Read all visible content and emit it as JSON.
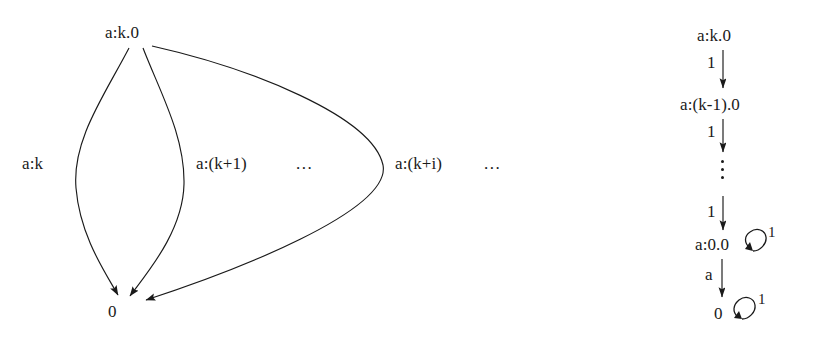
{
  "figure": {
    "background_color": "#ffffff",
    "stroke_color": "#1a1a1a"
  },
  "left_diagram": {
    "name": "infinitely-branching-transition-system",
    "nodes": [
      {
        "id": "top",
        "label": "a:k.0",
        "x": 136,
        "y": 33
      },
      {
        "id": "bottom",
        "label": "0",
        "x": 120,
        "y": 312
      }
    ],
    "edge_labels": [
      {
        "id": "edge-label-ak",
        "label": "a:k",
        "x": 22,
        "y": 163
      },
      {
        "id": "edge-label-ak1",
        "label": "a:(k+1)",
        "x": 196,
        "y": 163
      },
      {
        "id": "ellipsis-mid",
        "label": "...",
        "x": 298,
        "y": 163
      },
      {
        "id": "edge-label-aki",
        "label": "a:(k+i)",
        "x": 397,
        "y": 163
      },
      {
        "id": "ellipsis-right",
        "label": "...",
        "x": 485,
        "y": 163
      }
    ]
  },
  "right_diagram": {
    "name": "sequential-reduction-chain",
    "nodes": [
      {
        "id": "r1",
        "label": "a:k.0",
        "x": 727,
        "y": 36
      },
      {
        "id": "r2",
        "label": "a:(k-1).0",
        "x": 727,
        "y": 105
      },
      {
        "id": "r3",
        "label": "a:0.0",
        "x": 722,
        "y": 245
      },
      {
        "id": "r4",
        "label": "0",
        "x": 718,
        "y": 314
      }
    ],
    "vertical_ellipsis": {
      "id": "vertical-dots",
      "x": 723,
      "y": 160
    },
    "edge_labels": [
      {
        "id": "r-edge-1",
        "label": "1",
        "x": 708,
        "y": 62
      },
      {
        "id": "r-edge-2",
        "label": "1",
        "x": 708,
        "y": 131
      },
      {
        "id": "r-edge-3",
        "label": "1",
        "x": 708,
        "y": 211
      },
      {
        "id": "r-edge-4",
        "label": "a",
        "x": 706,
        "y": 274
      }
    ],
    "self_loops": [
      {
        "id": "self-loop-a00",
        "label": "1",
        "label_x": 770,
        "label_y": 230
      },
      {
        "id": "self-loop-zero",
        "label": "1",
        "label_x": 760,
        "label_y": 297
      }
    ]
  }
}
